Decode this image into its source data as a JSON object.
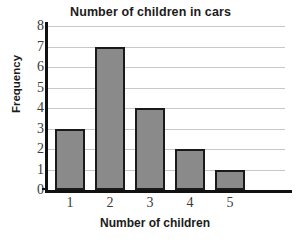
{
  "chart_data": {
    "type": "bar",
    "title": "Number of children in cars",
    "xlabel": "Number of children",
    "ylabel": "Frequency",
    "categories": [
      "1",
      "2",
      "3",
      "4",
      "5"
    ],
    "values": [
      3,
      7,
      4,
      2,
      1
    ],
    "ylim": [
      0,
      8
    ],
    "ytick_labels": [
      "0",
      "1",
      "2",
      "3",
      "4",
      "5",
      "6",
      "7",
      "8"
    ],
    "grid": true,
    "legend": "none",
    "bar_color": "#8a8a8a",
    "bar_edge_color": "#1a1a1a",
    "gridline_color": "#c8c8c8",
    "axis_color": "#111111",
    "background": "#ffffff"
  }
}
